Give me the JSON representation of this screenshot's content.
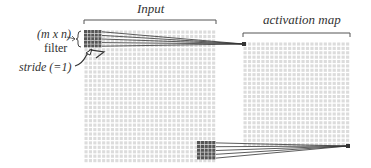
{
  "labels": {
    "input": "Input",
    "activation_map": "activation map",
    "filter_size": "(m x n)",
    "filter": "filter",
    "stride": "stride (=1)"
  },
  "colors": {
    "grid_cell": "#dcdcdc",
    "filter_cell": "#555555",
    "line": "#333333"
  },
  "input_grid": {
    "x": 84,
    "y": 30,
    "width": 132,
    "height": 133,
    "cols": 30,
    "rows": 30
  },
  "activation_grid": {
    "x": 243,
    "y": 42,
    "width": 107,
    "height": 105,
    "cols": 24,
    "rows": 24
  },
  "filters": [
    {
      "x": 84,
      "y": 30,
      "size": 18,
      "cells": 5,
      "target_x": 244,
      "target_y": 44
    },
    {
      "x": 197,
      "y": 141,
      "size": 19,
      "cells": 5,
      "target_x": 348,
      "target_y": 146
    }
  ]
}
